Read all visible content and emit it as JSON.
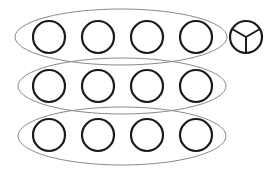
{
  "diagram": {
    "colors": {
      "background": "#ffffff",
      "circle_stroke": "#1a1a1a",
      "ellipse_stroke": "#8a8a8a"
    },
    "groups": [
      {
        "id": "row-1",
        "cy": 37,
        "ellipse": {
          "cx": 121,
          "cy": 37,
          "rx": 106,
          "ry": 28
        },
        "circles": [
          49,
          98,
          147,
          196
        ]
      },
      {
        "id": "row-2",
        "cy": 86,
        "ellipse": {
          "cx": 122,
          "cy": 86,
          "rx": 104,
          "ry": 28
        },
        "circles": [
          49,
          98,
          147,
          196
        ]
      },
      {
        "id": "row-3",
        "cy": 135,
        "ellipse": {
          "cx": 122,
          "cy": 136,
          "rx": 104,
          "ry": 29
        },
        "circles": [
          49,
          98,
          147,
          196
        ]
      }
    ],
    "circle_radius": 16,
    "divided_circle": {
      "cx": 246,
      "cy": 37,
      "r": 16,
      "sectors": 3
    }
  }
}
